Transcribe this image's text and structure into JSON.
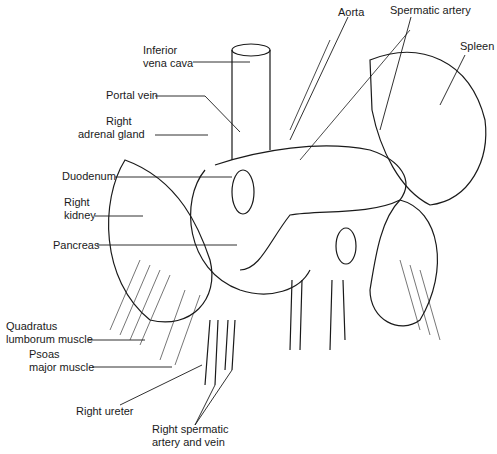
{
  "figure": {
    "type": "anatomical-illustration"
  },
  "labels": {
    "ivc": [
      "Inferior",
      "vena cava"
    ],
    "aorta": "Aorta",
    "spermatic_artery": "Spermatic artery",
    "spleen": "Spleen",
    "portal_vein": "Portal vein",
    "right_adrenal": [
      "Right",
      "adrenal gland"
    ],
    "duodenum": "Duodenum",
    "right_kidney": [
      "Right",
      "kidney"
    ],
    "pancreas": "Pancreas",
    "quadratus": [
      "Quadratus",
      "lumborum muscle"
    ],
    "psoas": [
      "Psoas",
      "major muscle"
    ],
    "right_ureter": "Right ureter",
    "right_spermatic": [
      "Right spermatic",
      "artery and vein"
    ]
  },
  "colors": {
    "line": "#1a1a1a",
    "background": "#ffffff"
  }
}
